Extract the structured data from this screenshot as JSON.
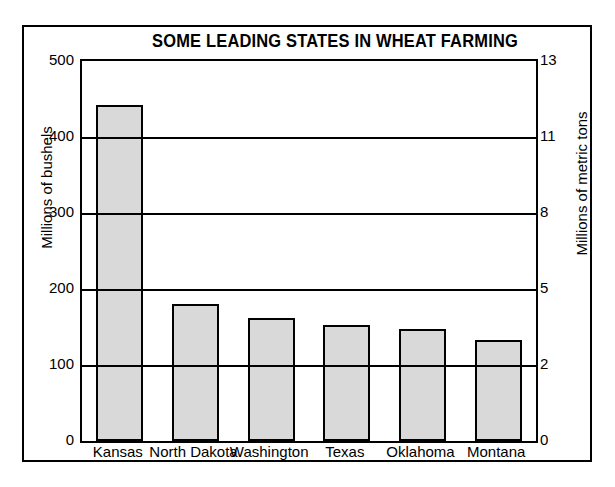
{
  "chart_data": {
    "type": "bar",
    "title": "SOME LEADING STATES IN WHEAT FARMING",
    "categories": [
      "Kansas",
      "North Dakota",
      "Washington",
      "Texas",
      "Oklahoma",
      "Montana"
    ],
    "values": [
      442,
      180,
      162,
      152,
      147,
      133
    ],
    "xlabel": "",
    "ylabel": "Millions of bushels",
    "ylabel_right": "Millions of metric tons",
    "ylim": [
      0,
      500
    ],
    "yticks": [
      0,
      100,
      200,
      300,
      400,
      500
    ],
    "ytick_labels": [
      "0",
      "100",
      "200",
      "300",
      "400",
      "500"
    ],
    "ylim_right": [
      0,
      13
    ],
    "yticks_right": [
      0,
      2,
      5,
      8,
      11,
      13
    ],
    "ytick_labels_right": [
      "0",
      "2",
      "5",
      "8",
      "11",
      "13"
    ],
    "grid": true,
    "legend": false,
    "bar_fill_color": "#d9d9d9",
    "bar_edge_color": "#000000",
    "background_color": "#ffffff"
  }
}
